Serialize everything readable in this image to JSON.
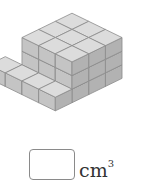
{
  "problem": {
    "figure_description": "isometric stack of unit cubes: 3x3x3 block with a 4-cube step in front",
    "unit_label": "cm",
    "unit_exponent": "3",
    "answer_value": ""
  },
  "figure": {
    "colors": {
      "top": "#dcdcdc",
      "left": "#c4c4c4",
      "right": "#b2b2b2",
      "edge": "#8c8c8c"
    },
    "origin": {
      "x": 72,
      "y": 54
    },
    "unit": {
      "dx": 11.5,
      "dy": 5.6,
      "h": 13.6
    },
    "cubes_note": "coordinates as [col(right-going axis), row(left-going axis), level]",
    "cubes": [
      [
        0,
        0,
        0
      ],
      [
        1,
        0,
        0
      ],
      [
        2,
        0,
        0
      ],
      [
        0,
        1,
        0
      ],
      [
        1,
        1,
        0
      ],
      [
        2,
        1,
        0
      ],
      [
        0,
        2,
        0
      ],
      [
        1,
        2,
        0
      ],
      [
        2,
        2,
        0
      ],
      [
        0,
        0,
        1
      ],
      [
        1,
        0,
        1
      ],
      [
        2,
        0,
        1
      ],
      [
        0,
        1,
        1
      ],
      [
        1,
        1,
        1
      ],
      [
        2,
        1,
        1
      ],
      [
        0,
        2,
        1
      ],
      [
        1,
        2,
        1
      ],
      [
        2,
        2,
        1
      ],
      [
        0,
        0,
        2
      ],
      [
        1,
        0,
        2
      ],
      [
        2,
        0,
        2
      ],
      [
        0,
        1,
        2
      ],
      [
        1,
        1,
        2
      ],
      [
        2,
        1,
        2
      ],
      [
        0,
        2,
        2
      ],
      [
        1,
        2,
        2
      ],
      [
        2,
        2,
        2
      ],
      [
        -1,
        3,
        0
      ],
      [
        0,
        3,
        0
      ],
      [
        1,
        3,
        0
      ],
      [
        2,
        3,
        0
      ]
    ]
  }
}
